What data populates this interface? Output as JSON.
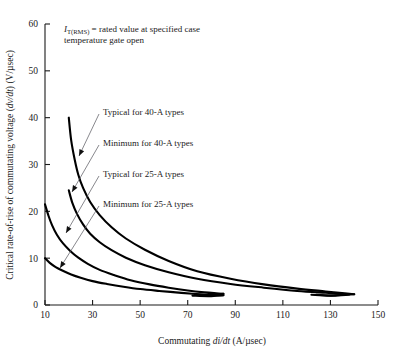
{
  "chart_data": {
    "type": "line",
    "title": "",
    "xlabel": "Commutating di/dt (A/µsec)",
    "ylabel": "Critical rate-of-rise of commutating voltage (dv/dt) (V/µsec)",
    "xlim": [
      10,
      150
    ],
    "ylim": [
      0,
      60
    ],
    "xticks": [
      10,
      30,
      50,
      70,
      90,
      110,
      130,
      150
    ],
    "yticks": [
      0,
      10,
      20,
      30,
      40,
      50,
      60
    ],
    "grid": false,
    "legend_position": "inline-annotations",
    "annotations": [
      {
        "name": "rated-value-note",
        "text": "= rated value at specified case temperature gate open",
        "symbol": "I",
        "subscript": "T(RMS)",
        "line1": "= rated value at specified case",
        "line2": "temperature gate open"
      }
    ],
    "series": [
      {
        "name": "Typical for 40-A types",
        "label": "Typical for 40-A types",
        "points": [
          [
            20,
            40.0
          ],
          [
            21,
            35.2
          ],
          [
            22.5,
            31.0
          ],
          [
            24,
            27.8
          ],
          [
            26,
            25.0
          ],
          [
            29,
            22.0
          ],
          [
            33,
            19.2
          ],
          [
            38,
            16.6
          ],
          [
            44,
            14.2
          ],
          [
            52,
            11.8
          ],
          [
            62,
            9.4
          ],
          [
            74,
            7.2
          ],
          [
            88,
            5.6
          ],
          [
            102,
            4.4
          ],
          [
            116,
            3.5
          ],
          [
            128,
            2.9
          ],
          [
            136,
            2.5
          ],
          [
            140,
            2.3
          ]
        ],
        "end_hook": [
          [
            140,
            2.3
          ],
          [
            132,
            2.0
          ],
          [
            124,
            2.2
          ]
        ]
      },
      {
        "name": "Minimum for 40-A types",
        "label": "Minimum for 40-A types",
        "points": [
          [
            20,
            24.5
          ],
          [
            21.5,
            21.8
          ],
          [
            23.5,
            19.4
          ],
          [
            26,
            17.2
          ],
          [
            29,
            15.2
          ],
          [
            33,
            13.4
          ],
          [
            38,
            11.7
          ],
          [
            44,
            10.1
          ],
          [
            52,
            8.5
          ],
          [
            62,
            7.0
          ],
          [
            74,
            5.6
          ],
          [
            88,
            4.5
          ],
          [
            102,
            3.7
          ],
          [
            116,
            3.0
          ],
          [
            128,
            2.6
          ],
          [
            134,
            2.4
          ],
          [
            138,
            2.3
          ]
        ],
        "end_hook": [
          [
            138,
            2.3
          ],
          [
            130,
            2.0
          ],
          [
            122,
            2.2
          ]
        ]
      },
      {
        "name": "Typical for 25-A types",
        "label": "Typical for 25-A types",
        "points": [
          [
            10,
            21.5
          ],
          [
            11.5,
            19.0
          ],
          [
            13,
            17.0
          ],
          [
            15,
            15.0
          ],
          [
            17.5,
            13.2
          ],
          [
            20.5,
            11.6
          ],
          [
            24,
            10.1
          ],
          [
            28,
            8.8
          ],
          [
            33,
            7.5
          ],
          [
            39,
            6.4
          ],
          [
            46,
            5.3
          ],
          [
            54,
            4.4
          ],
          [
            62,
            3.7
          ],
          [
            70,
            3.1
          ],
          [
            77,
            2.7
          ],
          [
            82,
            2.5
          ],
          [
            85,
            2.4
          ]
        ],
        "end_hook": [
          [
            85,
            2.4
          ],
          [
            79,
            2.1
          ],
          [
            73,
            2.3
          ]
        ]
      },
      {
        "name": "Minimum for 25-A types",
        "label": "Minimum for 25-A types",
        "points": [
          [
            10,
            10.0
          ],
          [
            12,
            9.0
          ],
          [
            14.5,
            8.1
          ],
          [
            17.5,
            7.3
          ],
          [
            21,
            6.5
          ],
          [
            25,
            5.8
          ],
          [
            30,
            5.1
          ],
          [
            36,
            4.5
          ],
          [
            43,
            3.9
          ],
          [
            50,
            3.4
          ],
          [
            58,
            3.0
          ],
          [
            65,
            2.7
          ],
          [
            72,
            2.4
          ],
          [
            78,
            2.2
          ],
          [
            83,
            2.1
          ],
          [
            85,
            2.1
          ]
        ],
        "end_hook": [
          [
            85,
            2.1
          ],
          [
            79,
            1.9
          ],
          [
            72,
            2.0
          ]
        ]
      }
    ],
    "label_anchors": [
      {
        "name": "Typical for 40-A types",
        "text_x": 103,
        "text_y": 112,
        "arrow_x": 79,
        "arrow_y": 156
      },
      {
        "name": "Minimum for 40-A types",
        "text_x": 103,
        "text_y": 143,
        "arrow_x": 72,
        "arrow_y": 192
      },
      {
        "name": "Typical for 25-A types",
        "text_x": 103,
        "text_y": 174,
        "arrow_x": 66,
        "arrow_y": 233
      },
      {
        "name": "Minimum for 25-A types",
        "text_x": 103,
        "text_y": 204,
        "arrow_x": 60,
        "arrow_y": 268
      }
    ]
  }
}
